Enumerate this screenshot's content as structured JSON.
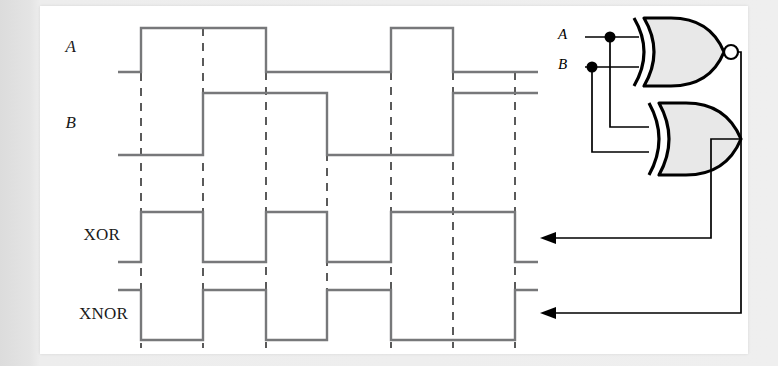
{
  "figure": {
    "kind": "logic-timing-diagram-with-circuit",
    "background_color": "#e9e9e9",
    "panel_color": "#ffffff",
    "wave_color": "#77787a",
    "dash_color": "#5a5a5a",
    "gate_fill": "#e8e8e8",
    "gate_stroke": "#000000"
  },
  "timing": {
    "labels": {
      "a": "A",
      "b": "B",
      "xor": "XOR",
      "xnor": "XNOR"
    },
    "time_markers": [
      141,
      203,
      266,
      327,
      391,
      453,
      515
    ],
    "x_start": 118,
    "x_end": 538,
    "signals": [
      {
        "name": "A",
        "label": "A",
        "style": "italic",
        "y_high": 28,
        "y_low": 72,
        "label_x": 76,
        "label_y": 48,
        "segments": [
          {
            "from": 118,
            "to": 141,
            "level": 0
          },
          {
            "from": 141,
            "to": 266,
            "level": 1
          },
          {
            "from": 266,
            "to": 391,
            "level": 0
          },
          {
            "from": 391,
            "to": 453,
            "level": 1
          },
          {
            "from": 453,
            "to": 538,
            "level": 0
          }
        ]
      },
      {
        "name": "B",
        "label": "B",
        "style": "italic",
        "y_high": 93,
        "y_low": 155,
        "label_x": 76,
        "label_y": 124,
        "segments": [
          {
            "from": 118,
            "to": 203,
            "level": 0
          },
          {
            "from": 203,
            "to": 327,
            "level": 1
          },
          {
            "from": 327,
            "to": 453,
            "level": 0
          },
          {
            "from": 453,
            "to": 538,
            "level": 1
          }
        ]
      },
      {
        "name": "XOR",
        "label": "XOR",
        "style": "plain",
        "y_high": 212,
        "y_low": 262,
        "label_x": 120,
        "label_y": 236,
        "segments": [
          {
            "from": 118,
            "to": 141,
            "level": 0
          },
          {
            "from": 141,
            "to": 203,
            "level": 1
          },
          {
            "from": 203,
            "to": 266,
            "level": 0
          },
          {
            "from": 266,
            "to": 327,
            "level": 1
          },
          {
            "from": 327,
            "to": 391,
            "level": 0
          },
          {
            "from": 391,
            "to": 515,
            "level": 1
          },
          {
            "from": 515,
            "to": 538,
            "level": 0
          }
        ]
      },
      {
        "name": "XNOR",
        "label": "XNOR",
        "style": "plain",
        "y_high": 290,
        "y_low": 340,
        "label_x": 128,
        "label_y": 315,
        "segments": [
          {
            "from": 118,
            "to": 141,
            "level": 1
          },
          {
            "from": 141,
            "to": 203,
            "level": 0
          },
          {
            "from": 203,
            "to": 266,
            "level": 1
          },
          {
            "from": 266,
            "to": 327,
            "level": 0
          },
          {
            "from": 327,
            "to": 391,
            "level": 1
          },
          {
            "from": 391,
            "to": 515,
            "level": 0
          },
          {
            "from": 515,
            "to": 538,
            "level": 1
          }
        ]
      }
    ],
    "dashed_lines": [
      {
        "x": 141,
        "y1": 28,
        "y2": 348
      },
      {
        "x": 203,
        "y1": 28,
        "y2": 348
      },
      {
        "x": 266,
        "y1": 72,
        "y2": 348
      },
      {
        "x": 327,
        "y1": 93,
        "y2": 348
      },
      {
        "x": 391,
        "y1": 72,
        "y2": 348
      },
      {
        "x": 453,
        "y1": 72,
        "y2": 348
      },
      {
        "x": 515,
        "y1": 72,
        "y2": 348
      }
    ]
  },
  "circuit": {
    "inputs": [
      {
        "label": "A",
        "x": 568,
        "y": 37
      },
      {
        "label": "B",
        "x": 568,
        "y": 67
      }
    ],
    "gates": [
      {
        "type": "xnor",
        "name": "xnor-gate",
        "has_bubble": true,
        "output_label": "XNOR"
      },
      {
        "type": "xor",
        "name": "xor-gate",
        "has_bubble": false,
        "output_label": "XOR"
      }
    ],
    "junction_dots": [
      {
        "x": 610,
        "y": 37
      },
      {
        "x": 592,
        "y": 67
      }
    ],
    "output_arrows": [
      {
        "target": "XOR",
        "y": 238
      },
      {
        "target": "XNOR",
        "y": 313
      }
    ]
  }
}
